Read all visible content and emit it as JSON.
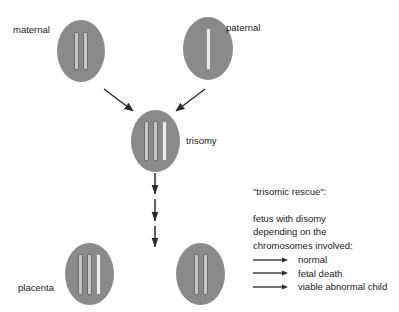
{
  "diagram": {
    "title": "trisomic rescue",
    "colors": {
      "cell_fill": "#8a8a8a",
      "chromosome_maternal": "#c6c6c6",
      "chromosome_paternal": "#ececec",
      "chromosome_outline": "#6e6e6e",
      "arrow": "#2b2b2b",
      "text": "#1a1a1a",
      "background": "#ffffff"
    },
    "cells": [
      {
        "id": "maternal",
        "label": "maternal",
        "label_position": "left",
        "chromosome_count": 2,
        "chromosomes": [
          "maternal",
          "maternal"
        ]
      },
      {
        "id": "paternal",
        "label": "paternal",
        "label_position": "right",
        "chromosome_count": 1,
        "chromosomes": [
          "paternal"
        ]
      },
      {
        "id": "trisomy",
        "label": "trisomy",
        "label_position": "right",
        "chromosome_count": 3,
        "chromosomes": [
          "maternal",
          "maternal",
          "paternal"
        ]
      },
      {
        "id": "placenta",
        "label": "placenta",
        "label_position": "left",
        "chromosome_count": 3,
        "chromosomes": [
          "maternal",
          "maternal",
          "paternal"
        ]
      },
      {
        "id": "fetus",
        "label": "",
        "label_position": "none",
        "chromosome_count": 2,
        "chromosomes": [
          "maternal",
          "maternal"
        ]
      }
    ],
    "arrows": {
      "maternal_to_trisomy": "diagonal down-right",
      "paternal_to_trisomy": "diagonal down-left",
      "trisomy_to_products": "three stacked vertical arrows"
    }
  },
  "info": {
    "heading": "\"trisomic rescue\":",
    "body": [
      "fetus with disomy",
      "depending on the",
      "chromosomes involved:"
    ],
    "outcomes": [
      {
        "label": "normal"
      },
      {
        "label": "fetal death"
      },
      {
        "label": "viable abnormal child"
      }
    ]
  }
}
